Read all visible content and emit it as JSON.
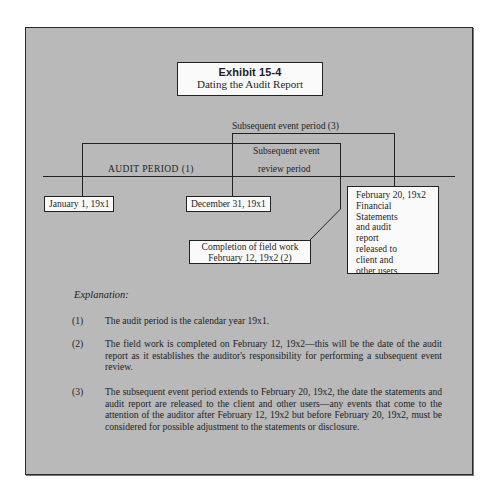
{
  "exhibit": {
    "number": "Exhibit 15-4",
    "title": "Dating the Audit Report"
  },
  "diagram": {
    "subsequent_event_period_label": "Subsequent event period (3)",
    "review_period_label_line1": "Subsequent event",
    "review_period_label_line2": "review period",
    "audit_period_label": "AUDIT PERIOD (1)",
    "dates": {
      "start": "January 1, 19x1",
      "year_end": "December 31, 19x1",
      "completion_line1": "Completion of field work",
      "completion_line2": "February 12, 19x2 (2)",
      "release_lines": [
        "February 20, 19x2",
        "Financial",
        "Statements",
        "and audit",
        "report",
        "released to",
        "client and",
        "other users."
      ]
    }
  },
  "explanation": {
    "heading": "Explanation:",
    "items": [
      {
        "number": "(1)",
        "text": "The audit period is the calendar year 19x1."
      },
      {
        "number": "(2)",
        "text": "The field work is completed on February 12, 19x2—this will be the date of the audit report as it establishes the auditor's responsibility for performing a subsequent event review."
      },
      {
        "number": "(3)",
        "text": "The subsequent event period extends to February 20, 19x2, the date the statements and audit report are released to the client and other users—any events that come to the attention of the auditor after February 12, 19x2 but before February 20, 19x2, must be considered for possible adjustment to the statements or disclosure."
      }
    ]
  }
}
